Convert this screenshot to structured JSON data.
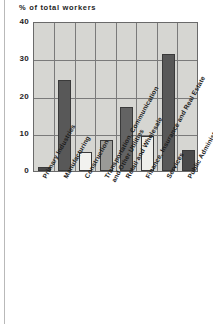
{
  "figure": {
    "axis_title": "% of total workers",
    "background": "#ffffff",
    "plot_background": "#d6d6d2",
    "frame_color": "#6a6a6a"
  },
  "chart_data": {
    "type": "bar",
    "title": "",
    "xlabel": "",
    "ylabel": "% of total workers",
    "ylim": [
      0,
      40
    ],
    "yticks": [
      0,
      10,
      20,
      30,
      40
    ],
    "grid": true,
    "legend": "none",
    "categories": [
      "Primary Industries",
      "Manufacturing",
      "Construction",
      "Transportation, Communication\nand Other Utilities",
      "Retail and Wholesale",
      "Finance, Insurance and Real Estate",
      "Services",
      "Public Administration"
    ],
    "values": [
      1.0,
      24.3,
      5.2,
      8.3,
      17.2,
      9.3,
      31.2,
      5.5
    ],
    "bar_colors": [
      "#4a4a4a",
      "#585858",
      "#f2f2ef",
      "#9a9a97",
      "#636363",
      "#eeeeea",
      "#585858",
      "#4a4a4a"
    ]
  },
  "yticklabels": [
    "40",
    "30",
    "20",
    "10",
    "0"
  ]
}
